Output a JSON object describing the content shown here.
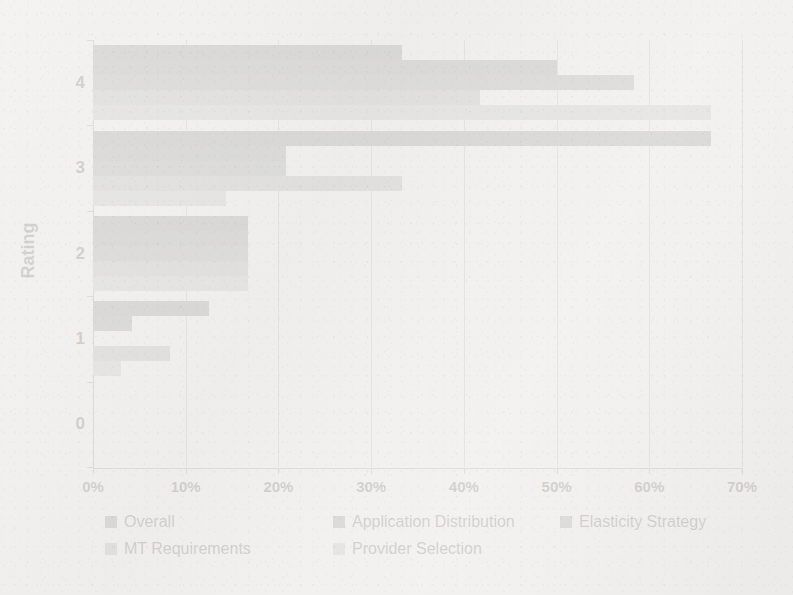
{
  "chart_data": {
    "type": "bar",
    "orientation": "horizontal",
    "title": "",
    "xlabel": "",
    "ylabel": "Rating",
    "categories": [
      "0",
      "1",
      "2",
      "3",
      "4"
    ],
    "xlim": [
      0,
      70
    ],
    "xtick_labels": [
      "0%",
      "10%",
      "20%",
      "30%",
      "40%",
      "50%",
      "60%",
      "70%"
    ],
    "xtick_values": [
      0,
      10,
      20,
      30,
      40,
      50,
      60,
      70
    ],
    "ytick_labels": [
      "0",
      "1",
      "2",
      "3",
      "4"
    ],
    "grid": true,
    "grid_axis": "x",
    "legend_position": "bottom",
    "value_suffix": "%",
    "series": [
      {
        "name": "Overall",
        "color": "#595959",
        "values": [
          0,
          12.5,
          16.7,
          66.7,
          33.3
        ]
      },
      {
        "name": "Application Distribution",
        "color": "#626262",
        "values": [
          0,
          4.2,
          16.7,
          20.8,
          50.0
        ]
      },
      {
        "name": "Elasticity Strategy",
        "color": "#6e6e6e",
        "values": [
          0,
          0,
          16.7,
          20.8,
          58.3
        ]
      },
      {
        "name": "MT Requirements",
        "color": "#8c8c8c",
        "values": [
          0,
          8.3,
          16.7,
          33.3,
          41.7
        ]
      },
      {
        "name": "Provider Selection",
        "color": "#a6a6a6",
        "values": [
          0,
          3.0,
          16.7,
          14.3,
          66.7
        ]
      }
    ]
  },
  "axis": {
    "y_title": "Rating"
  },
  "legend": {
    "items": [
      {
        "label": "Overall",
        "color": "#595959"
      },
      {
        "label": "Application Distribution",
        "color": "#626262"
      },
      {
        "label": "Elasticity Strategy",
        "color": "#6e6e6e"
      },
      {
        "label": "MT Requirements",
        "color": "#8c8c8c"
      },
      {
        "label": "Provider Selection",
        "color": "#a6a6a6"
      }
    ]
  }
}
